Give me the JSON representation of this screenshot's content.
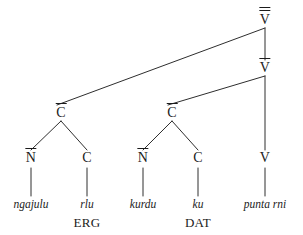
{
  "figure": {
    "kind": "syntax-tree",
    "width": 303,
    "height": 235,
    "background": "#ffffff",
    "line_color": "#2e2e2e",
    "text_color": "#1b1b1b"
  },
  "nodes": [
    {
      "id": "v-double-bar",
      "label": "V",
      "bars": 2,
      "x": 265,
      "y": 20
    },
    {
      "id": "v-bar",
      "label": "V",
      "bars": 1,
      "x": 265,
      "y": 68
    },
    {
      "id": "c-bar-1",
      "label": "C",
      "bars": 1,
      "x": 61,
      "y": 113
    },
    {
      "id": "c-bar-2",
      "label": "C",
      "bars": 1,
      "x": 172,
      "y": 113
    },
    {
      "id": "n-bar-1",
      "label": "N",
      "bars": 1,
      "x": 31,
      "y": 158
    },
    {
      "id": "c-1",
      "label": "C",
      "bars": 0,
      "x": 87,
      "y": 158
    },
    {
      "id": "n-bar-2",
      "label": "N",
      "bars": 1,
      "x": 143,
      "y": 158
    },
    {
      "id": "c-2",
      "label": "C",
      "bars": 0,
      "x": 198,
      "y": 158
    },
    {
      "id": "v-head",
      "label": "V",
      "bars": 0,
      "x": 265,
      "y": 158
    }
  ],
  "edges": [
    {
      "id": "edge-vdb-cbar1",
      "from": "v-double-bar",
      "to": "c-bar-1",
      "x1": 265,
      "y1": 28,
      "x2": 57,
      "y2": 105
    },
    {
      "id": "edge-vdb-vbar",
      "from": "v-double-bar",
      "to": "v-bar",
      "x1": 265,
      "y1": 28,
      "x2": 265,
      "y2": 60
    },
    {
      "id": "edge-vbar-cbar2",
      "from": "v-bar",
      "to": "c-bar-2",
      "x1": 265,
      "y1": 76,
      "x2": 168,
      "y2": 105
    },
    {
      "id": "edge-vbar-vhead",
      "from": "v-bar",
      "to": "v-head",
      "x1": 265,
      "y1": 76,
      "x2": 265,
      "y2": 150
    },
    {
      "id": "edge-cbar1-nbar1",
      "from": "c-bar-1",
      "to": "n-bar-1",
      "x1": 61,
      "y1": 121,
      "x2": 31,
      "y2": 150
    },
    {
      "id": "edge-cbar1-c1",
      "from": "c-bar-1",
      "to": "c-1",
      "x1": 61,
      "y1": 121,
      "x2": 87,
      "y2": 150
    },
    {
      "id": "edge-cbar2-nbar2",
      "from": "c-bar-2",
      "to": "n-bar-2",
      "x1": 172,
      "y1": 121,
      "x2": 143,
      "y2": 150
    },
    {
      "id": "edge-cbar2-c2",
      "from": "c-bar-2",
      "to": "c-2",
      "x1": 172,
      "y1": 121,
      "x2": 198,
      "y2": 150
    },
    {
      "id": "edge-nbar1-w1",
      "from": "n-bar-1",
      "to": "word-1",
      "x1": 31,
      "y1": 168,
      "x2": 31,
      "y2": 196
    },
    {
      "id": "edge-c1-w2",
      "from": "c-1",
      "to": "word-2",
      "x1": 87,
      "y1": 168,
      "x2": 87,
      "y2": 196
    },
    {
      "id": "edge-nbar2-w3",
      "from": "n-bar-2",
      "to": "word-3",
      "x1": 143,
      "y1": 168,
      "x2": 143,
      "y2": 196
    },
    {
      "id": "edge-c2-w4",
      "from": "c-2",
      "to": "word-4",
      "x1": 198,
      "y1": 168,
      "x2": 198,
      "y2": 196
    },
    {
      "id": "edge-vhead-w5",
      "from": "v-head",
      "to": "word-5",
      "x1": 265,
      "y1": 168,
      "x2": 265,
      "y2": 196
    }
  ],
  "terminals": [
    {
      "id": "word-1",
      "word": "ngajulu",
      "gloss": "",
      "x": 31,
      "y": 205,
      "gloss_y": 222
    },
    {
      "id": "word-2",
      "word": "rlu",
      "gloss": "ERG",
      "x": 87,
      "y": 205,
      "gloss_y": 222
    },
    {
      "id": "word-3",
      "word": "kurdu",
      "gloss": "",
      "x": 143,
      "y": 205,
      "gloss_y": 222
    },
    {
      "id": "word-4",
      "word": "ku",
      "gloss": "DAT",
      "x": 198,
      "y": 205,
      "gloss_y": 222
    },
    {
      "id": "word-5",
      "word": "punta rni",
      "gloss": "",
      "x": 265,
      "y": 205,
      "gloss_y": 222
    }
  ]
}
